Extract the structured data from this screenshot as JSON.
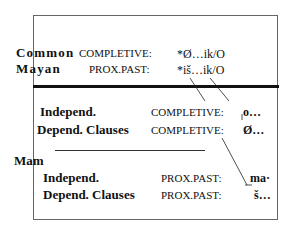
{
  "diagram": {
    "proto": {
      "label_line1": "Common",
      "label_line2": "Mayan",
      "rows": [
        {
          "category": "COMPLETIVE:",
          "form": "*Ø…ik/O"
        },
        {
          "category": "PROX.PAST:",
          "form": "*iš…ik/O"
        }
      ]
    },
    "group1": {
      "rows": [
        {
          "clause": "Independ.",
          "category": "COMPLETIVE:",
          "form": "o…"
        },
        {
          "clause": "Depend.  Clauses",
          "category": "COMPLETIVE:",
          "form": "Ø…"
        }
      ]
    },
    "mam": {
      "label": "Mam",
      "rows": [
        {
          "clause": "Independ.",
          "category": "PROX.PAST:",
          "form": "ma·"
        },
        {
          "clause": "Depend.  Clauses",
          "category": "PROX.PAST:",
          "form": "š…"
        }
      ]
    }
  }
}
